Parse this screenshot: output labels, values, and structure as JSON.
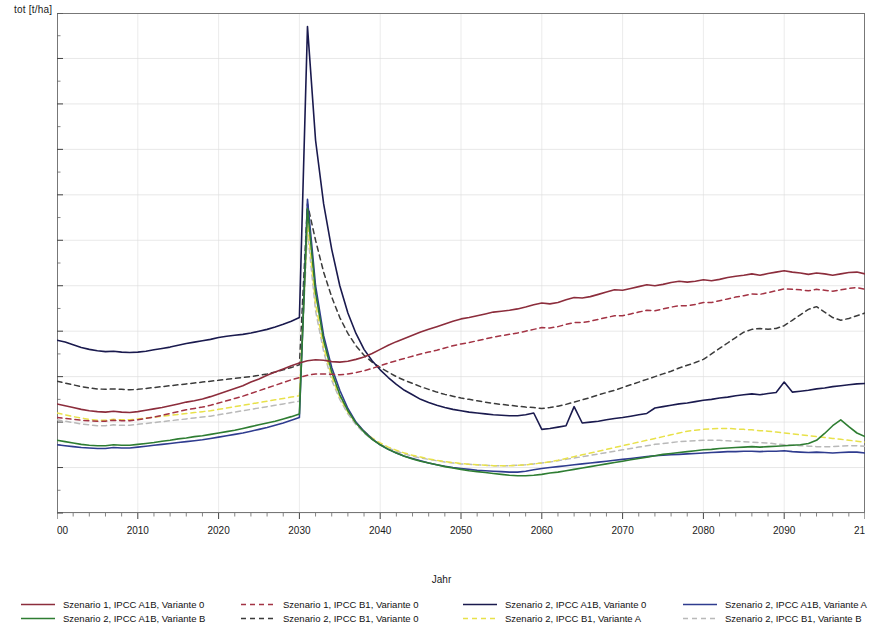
{
  "axes": {
    "ylabel": "tot [t/ha]",
    "xlabel": "Jahr",
    "yticks": [
      "60",
      "70",
      "80",
      "90",
      "100",
      "110",
      "120",
      "130",
      "140",
      "150",
      "160",
      "170"
    ],
    "xticks": [
      "2000",
      "2010",
      "2020",
      "2030",
      "2040",
      "2050",
      "2060",
      "2070",
      "2080",
      "2090",
      "2100"
    ]
  },
  "legend": {
    "items": [
      {
        "label": "Szenario 1, IPCC A1B, Variante 0",
        "color": "#8c2d3c",
        "style": "solid",
        "col": 0,
        "row": 0
      },
      {
        "label": "Szenario 2, IPCC A1B, Variante B",
        "color": "#2e7d32",
        "style": "solid",
        "col": 0,
        "row": 1
      },
      {
        "label": "Szenario 1, IPCC B1, Variante 0",
        "color": "#a33344",
        "style": "dashed",
        "col": 1,
        "row": 0
      },
      {
        "label": "Szenario 2, IPCC B1, Variante 0",
        "color": "#3b3b3b",
        "style": "dashed",
        "col": 1,
        "row": 1
      },
      {
        "label": "Szenario 2, IPCC A1B, Variante 0",
        "color": "#1a1a4e",
        "style": "solid",
        "col": 2,
        "row": 0
      },
      {
        "label": "Szenario 2, IPCC B1, Variante A",
        "color": "#e8e14a",
        "style": "dashed",
        "col": 2,
        "row": 1
      },
      {
        "label": "Szenario 2, IPCC A1B, Variante A",
        "color": "#2f3c8f",
        "style": "solid",
        "col": 3,
        "row": 0
      },
      {
        "label": "Szenario 2, IPCC B1, Variante B",
        "color": "#b9b9b9",
        "style": "dashed",
        "col": 3,
        "row": 1
      }
    ]
  },
  "chart_data": {
    "type": "line",
    "title": "",
    "xlabel": "Jahr",
    "ylabel": "tot [t/ha]",
    "xlim": [
      2000,
      2100
    ],
    "ylim": [
      60,
      170
    ],
    "grid": true,
    "legend_position": "bottom",
    "x": [
      2000,
      2001,
      2002,
      2003,
      2004,
      2005,
      2006,
      2007,
      2008,
      2009,
      2010,
      2011,
      2012,
      2013,
      2014,
      2015,
      2016,
      2017,
      2018,
      2019,
      2020,
      2021,
      2022,
      2023,
      2024,
      2025,
      2026,
      2027,
      2028,
      2029,
      2030,
      2031,
      2032,
      2033,
      2034,
      2035,
      2036,
      2037,
      2038,
      2039,
      2040,
      2041,
      2042,
      2043,
      2044,
      2045,
      2046,
      2047,
      2048,
      2049,
      2050,
      2051,
      2052,
      2053,
      2054,
      2055,
      2056,
      2057,
      2058,
      2059,
      2060,
      2061,
      2062,
      2063,
      2064,
      2065,
      2066,
      2067,
      2068,
      2069,
      2070,
      2071,
      2072,
      2073,
      2074,
      2075,
      2076,
      2077,
      2078,
      2079,
      2080,
      2081,
      2082,
      2083,
      2084,
      2085,
      2086,
      2087,
      2088,
      2089,
      2090,
      2091,
      2092,
      2093,
      2094,
      2095,
      2096,
      2097,
      2098,
      2099,
      2100
    ],
    "series": [
      {
        "name": "Szenario 1, IPCC A1B, Variante 0",
        "color": "#8c2d3c",
        "style": "solid",
        "values": [
          84.0,
          83.6,
          83.2,
          82.8,
          82.5,
          82.3,
          82.2,
          82.4,
          82.2,
          82.1,
          82.3,
          82.6,
          82.9,
          83.2,
          83.6,
          84.0,
          84.4,
          84.7,
          85.1,
          85.6,
          86.2,
          86.8,
          87.4,
          88.0,
          88.8,
          89.5,
          90.3,
          91.0,
          91.7,
          92.4,
          93.0,
          93.5,
          93.7,
          93.6,
          93.3,
          93.2,
          93.4,
          93.8,
          94.3,
          95.1,
          96.0,
          96.9,
          97.7,
          98.4,
          99.1,
          99.8,
          100.4,
          101.0,
          101.6,
          102.2,
          102.7,
          103.0,
          103.4,
          103.8,
          104.2,
          104.4,
          104.6,
          104.9,
          105.3,
          105.8,
          106.2,
          106.0,
          106.3,
          106.9,
          107.4,
          107.3,
          107.6,
          108.1,
          108.6,
          109.1,
          109.0,
          109.4,
          109.8,
          110.2,
          110.0,
          110.3,
          110.7,
          111.0,
          110.8,
          111.0,
          111.3,
          111.1,
          111.4,
          111.8,
          112.1,
          112.3,
          112.6,
          112.3,
          112.7,
          113.0,
          113.3,
          113.0,
          112.8,
          112.5,
          112.8,
          112.6,
          112.3,
          112.6,
          112.9,
          113.0,
          112.6
        ]
      },
      {
        "name": "Szenario 1, IPCC B1, Variante 0",
        "color": "#a33344",
        "style": "dashed",
        "values": [
          81.0,
          80.8,
          80.6,
          80.4,
          80.3,
          80.2,
          80.2,
          80.4,
          80.3,
          80.3,
          80.5,
          80.8,
          81.1,
          81.5,
          81.9,
          82.3,
          82.7,
          83.0,
          83.3,
          83.7,
          84.2,
          84.7,
          85.2,
          85.7,
          86.3,
          86.9,
          87.5,
          88.1,
          88.7,
          89.3,
          89.8,
          90.3,
          90.6,
          90.6,
          90.5,
          90.4,
          90.6,
          90.9,
          91.3,
          91.8,
          92.4,
          93.0,
          93.5,
          94.0,
          94.5,
          95.0,
          95.4,
          95.8,
          96.3,
          96.8,
          97.2,
          97.5,
          97.9,
          98.3,
          98.7,
          99.0,
          99.3,
          99.6,
          100.0,
          100.4,
          100.8,
          100.7,
          101.0,
          101.5,
          101.9,
          101.9,
          102.2,
          102.6,
          103.0,
          103.4,
          103.4,
          103.8,
          104.2,
          104.6,
          104.5,
          104.9,
          105.3,
          105.6,
          105.6,
          105.9,
          106.3,
          106.3,
          106.7,
          107.1,
          107.5,
          107.8,
          108.2,
          108.1,
          108.5,
          108.9,
          109.3,
          109.2,
          109.1,
          108.9,
          109.2,
          109.0,
          108.8,
          109.1,
          109.4,
          109.6,
          109.2
        ]
      },
      {
        "name": "Szenario 2, IPCC A1B, Variante 0",
        "color": "#1a1a4e",
        "style": "solid",
        "values": [
          98.0,
          97.6,
          97.0,
          96.4,
          96.0,
          95.7,
          95.5,
          95.6,
          95.4,
          95.3,
          95.4,
          95.6,
          95.9,
          96.2,
          96.5,
          96.9,
          97.3,
          97.6,
          97.9,
          98.2,
          98.6,
          98.9,
          99.1,
          99.3,
          99.6,
          100.0,
          100.4,
          100.9,
          101.5,
          102.2,
          103.0,
          167.0,
          142.0,
          128.0,
          118.0,
          110.0,
          104.0,
          99.5,
          96.0,
          93.5,
          91.5,
          89.8,
          88.3,
          87.0,
          86.0,
          85.0,
          84.3,
          83.7,
          83.2,
          82.8,
          82.5,
          82.2,
          82.0,
          81.8,
          81.6,
          81.5,
          81.4,
          81.4,
          81.6,
          82.0,
          78.4,
          78.6,
          78.9,
          79.2,
          83.4,
          79.8,
          80.0,
          80.2,
          80.5,
          80.8,
          81.0,
          81.3,
          81.6,
          81.9,
          83.1,
          83.4,
          83.7,
          84.0,
          84.2,
          84.5,
          84.8,
          85.0,
          85.3,
          85.5,
          85.8,
          86.0,
          86.2,
          86.0,
          86.3,
          86.5,
          88.8,
          86.6,
          86.8,
          87.0,
          87.3,
          87.5,
          87.8,
          88.0,
          88.2,
          88.4,
          88.5
        ]
      },
      {
        "name": "Szenario 2, IPCC B1, Variante 0",
        "color": "#3b3b3b",
        "style": "dashed",
        "values": [
          89.0,
          88.6,
          88.2,
          87.8,
          87.5,
          87.3,
          87.2,
          87.3,
          87.2,
          87.1,
          87.2,
          87.4,
          87.6,
          87.8,
          88.0,
          88.2,
          88.4,
          88.6,
          88.8,
          89.0,
          89.2,
          89.4,
          89.6,
          89.8,
          90.0,
          90.3,
          90.6,
          91.0,
          91.5,
          92.0,
          92.6,
          128.0,
          120.0,
          113.0,
          107.5,
          103.0,
          99.5,
          96.8,
          94.7,
          93.2,
          92.0,
          91.0,
          90.0,
          89.2,
          88.5,
          87.8,
          87.2,
          86.6,
          86.1,
          85.7,
          85.3,
          85.0,
          84.7,
          84.4,
          84.1,
          83.9,
          83.7,
          83.5,
          83.3,
          83.2,
          83.0,
          83.2,
          83.5,
          83.9,
          84.4,
          84.9,
          85.4,
          86.0,
          86.5,
          87.0,
          87.6,
          88.2,
          88.8,
          89.4,
          90.0,
          90.6,
          91.2,
          91.9,
          92.5,
          93.1,
          93.8,
          95.0,
          96.2,
          97.4,
          98.6,
          99.8,
          100.4,
          100.6,
          100.4,
          100.6,
          101.2,
          102.4,
          103.6,
          104.8,
          105.4,
          104.2,
          103.0,
          102.4,
          102.8,
          103.4,
          104.0
        ]
      },
      {
        "name": "Szenario 2, IPCC A1B, Variante A",
        "color": "#2f3c8f",
        "style": "solid",
        "values": [
          75.0,
          74.8,
          74.6,
          74.4,
          74.3,
          74.2,
          74.2,
          74.4,
          74.3,
          74.3,
          74.5,
          74.7,
          74.9,
          75.1,
          75.3,
          75.5,
          75.7,
          75.9,
          76.1,
          76.4,
          76.7,
          77.0,
          77.3,
          77.6,
          78.0,
          78.4,
          78.8,
          79.3,
          79.8,
          80.4,
          81.0,
          129.0,
          110.0,
          99.0,
          92.0,
          87.0,
          83.0,
          80.0,
          78.0,
          76.3,
          75.0,
          74.0,
          73.2,
          72.5,
          72.0,
          71.5,
          71.0,
          70.6,
          70.3,
          70.0,
          69.8,
          69.6,
          69.4,
          69.3,
          69.2,
          69.1,
          69.0,
          69.0,
          69.2,
          69.5,
          69.8,
          70.0,
          70.2,
          70.4,
          70.6,
          70.8,
          71.0,
          71.2,
          71.4,
          71.6,
          71.8,
          72.0,
          72.2,
          72.4,
          72.6,
          72.7,
          72.8,
          72.9,
          73.0,
          73.1,
          73.2,
          73.3,
          73.4,
          73.5,
          73.5,
          73.6,
          73.6,
          73.5,
          73.6,
          73.6,
          73.7,
          73.5,
          73.4,
          73.3,
          73.4,
          73.3,
          73.2,
          73.3,
          73.4,
          73.4,
          73.2
        ]
      },
      {
        "name": "Szenario 2, IPCC A1B, Variante B",
        "color": "#2e7d32",
        "style": "solid",
        "values": [
          76.0,
          75.7,
          75.4,
          75.1,
          74.9,
          74.8,
          74.8,
          75.0,
          74.9,
          74.9,
          75.1,
          75.3,
          75.5,
          75.8,
          76.0,
          76.3,
          76.5,
          76.8,
          77.0,
          77.3,
          77.6,
          77.9,
          78.2,
          78.6,
          79.0,
          79.4,
          79.8,
          80.2,
          80.7,
          81.2,
          81.8,
          127.0,
          108.5,
          98.0,
          91.0,
          86.0,
          82.5,
          79.8,
          77.8,
          76.2,
          75.0,
          74.0,
          73.2,
          72.5,
          71.9,
          71.4,
          71.0,
          70.6,
          70.2,
          69.9,
          69.6,
          69.3,
          69.1,
          68.9,
          68.7,
          68.5,
          68.3,
          68.2,
          68.2,
          68.3,
          68.5,
          68.8,
          69.0,
          69.3,
          69.6,
          69.9,
          70.2,
          70.5,
          70.8,
          71.1,
          71.4,
          71.7,
          72.0,
          72.3,
          72.6,
          72.9,
          73.1,
          73.3,
          73.5,
          73.7,
          73.9,
          74.0,
          74.2,
          74.3,
          74.4,
          74.5,
          74.6,
          74.5,
          74.6,
          74.7,
          74.8,
          74.9,
          75.0,
          75.3,
          76.0,
          77.5,
          79.2,
          80.5,
          79.0,
          77.6,
          76.8
        ]
      },
      {
        "name": "Szenario 2, IPCC B1, Variante A",
        "color": "#e8e14a",
        "style": "dashed",
        "values": [
          82.0,
          81.6,
          81.2,
          80.9,
          80.6,
          80.4,
          80.4,
          80.6,
          80.5,
          80.5,
          80.7,
          80.9,
          81.1,
          81.3,
          81.5,
          81.7,
          81.9,
          82.1,
          82.3,
          82.5,
          82.8,
          83.1,
          83.4,
          83.7,
          84.0,
          84.3,
          84.6,
          84.9,
          85.2,
          85.5,
          85.8,
          124.0,
          106.0,
          96.5,
          90.0,
          85.5,
          82.2,
          79.8,
          78.0,
          76.5,
          75.4,
          74.5,
          73.8,
          73.2,
          72.7,
          72.3,
          71.9,
          71.6,
          71.3,
          71.1,
          70.9,
          70.7,
          70.6,
          70.5,
          70.4,
          70.4,
          70.4,
          70.5,
          70.6,
          70.8,
          71.0,
          71.3,
          71.6,
          72.0,
          72.4,
          72.8,
          73.2,
          73.6,
          74.0,
          74.4,
          74.8,
          75.2,
          75.6,
          76.0,
          76.4,
          76.8,
          77.2,
          77.6,
          78.0,
          78.2,
          78.4,
          78.5,
          78.6,
          78.6,
          78.5,
          78.4,
          78.3,
          78.1,
          78.0,
          77.8,
          77.6,
          77.4,
          77.2,
          77.0,
          76.8,
          76.6,
          76.4,
          76.2,
          76.0,
          75.8,
          75.6
        ]
      },
      {
        "name": "Szenario 2, IPCC B1, Variante B",
        "color": "#b9b9b9",
        "style": "dashed",
        "values": [
          80.5,
          80.2,
          79.9,
          79.6,
          79.4,
          79.2,
          79.2,
          79.4,
          79.3,
          79.3,
          79.5,
          79.7,
          79.9,
          80.1,
          80.3,
          80.5,
          80.7,
          80.9,
          81.1,
          81.3,
          81.6,
          81.9,
          82.2,
          82.5,
          82.8,
          83.1,
          83.4,
          83.7,
          84.0,
          84.3,
          84.6,
          122.0,
          104.5,
          95.5,
          89.2,
          85.0,
          81.8,
          79.4,
          77.6,
          76.2,
          75.1,
          74.3,
          73.6,
          73.0,
          72.5,
          72.1,
          71.8,
          71.5,
          71.2,
          71.0,
          70.8,
          70.7,
          70.6,
          70.5,
          70.4,
          70.4,
          70.4,
          70.5,
          70.6,
          70.8,
          71.0,
          71.2,
          71.5,
          71.8,
          72.1,
          72.4,
          72.7,
          73.0,
          73.3,
          73.6,
          73.9,
          74.2,
          74.5,
          74.8,
          75.1,
          75.3,
          75.5,
          75.7,
          75.8,
          75.9,
          76.0,
          76.0,
          76.0,
          75.9,
          75.8,
          75.7,
          75.6,
          75.5,
          75.4,
          75.2,
          75.0,
          74.9,
          74.8,
          74.7,
          74.6,
          74.6,
          74.6,
          74.7,
          74.8,
          74.8,
          74.7
        ]
      }
    ]
  }
}
